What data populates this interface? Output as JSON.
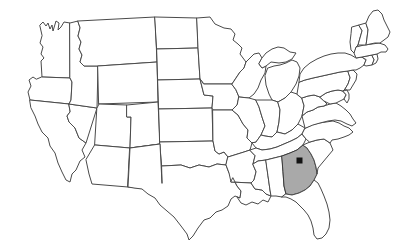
{
  "figure": {
    "kind": "choropleth-locator-map",
    "title": "",
    "caption": "",
    "background_color": "#ffffff",
    "width": 405,
    "height": 251
  },
  "map": {
    "region": "United States",
    "projection_style": "albers-usa-like",
    "default_state_fill": "#ffffff",
    "state_border_color": "#4a4a4a",
    "highlight_fill": "#a9a9a9",
    "highlight_border_color": "#3a3a3a",
    "marker_color": "#121212",
    "marker_shape": "square",
    "highlighted_states": [
      "Georgia"
    ],
    "markers": [
      {
        "name": "capital-marker",
        "state": "Georgia",
        "label": "",
        "x": 299.5,
        "y": 160.5,
        "size": 6
      }
    ],
    "states": [
      {
        "code": "WA",
        "name": "Washington",
        "highlighted": false
      },
      {
        "code": "OR",
        "name": "Oregon",
        "highlighted": false
      },
      {
        "code": "CA",
        "name": "California",
        "highlighted": false
      },
      {
        "code": "NV",
        "name": "Nevada",
        "highlighted": false
      },
      {
        "code": "ID",
        "name": "Idaho",
        "highlighted": false
      },
      {
        "code": "MT",
        "name": "Montana",
        "highlighted": false
      },
      {
        "code": "WY",
        "name": "Wyoming",
        "highlighted": false
      },
      {
        "code": "UT",
        "name": "Utah",
        "highlighted": false
      },
      {
        "code": "AZ",
        "name": "Arizona",
        "highlighted": false
      },
      {
        "code": "CO",
        "name": "Colorado",
        "highlighted": false
      },
      {
        "code": "NM",
        "name": "New Mexico",
        "highlighted": false
      },
      {
        "code": "ND",
        "name": "North Dakota",
        "highlighted": false
      },
      {
        "code": "SD",
        "name": "South Dakota",
        "highlighted": false
      },
      {
        "code": "NE",
        "name": "Nebraska",
        "highlighted": false
      },
      {
        "code": "KS",
        "name": "Kansas",
        "highlighted": false
      },
      {
        "code": "OK",
        "name": "Oklahoma",
        "highlighted": false
      },
      {
        "code": "TX",
        "name": "Texas",
        "highlighted": false
      },
      {
        "code": "MN",
        "name": "Minnesota",
        "highlighted": false
      },
      {
        "code": "IA",
        "name": "Iowa",
        "highlighted": false
      },
      {
        "code": "MO",
        "name": "Missouri",
        "highlighted": false
      },
      {
        "code": "AR",
        "name": "Arkansas",
        "highlighted": false
      },
      {
        "code": "LA",
        "name": "Louisiana",
        "highlighted": false
      },
      {
        "code": "WI",
        "name": "Wisconsin",
        "highlighted": false
      },
      {
        "code": "IL",
        "name": "Illinois",
        "highlighted": false
      },
      {
        "code": "MI",
        "name": "Michigan",
        "highlighted": false
      },
      {
        "code": "IN",
        "name": "Indiana",
        "highlighted": false
      },
      {
        "code": "OH",
        "name": "Ohio",
        "highlighted": false
      },
      {
        "code": "KY",
        "name": "Kentucky",
        "highlighted": false
      },
      {
        "code": "TN",
        "name": "Tennessee",
        "highlighted": false
      },
      {
        "code": "MS",
        "name": "Mississippi",
        "highlighted": false
      },
      {
        "code": "AL",
        "name": "Alabama",
        "highlighted": false
      },
      {
        "code": "GA",
        "name": "Georgia",
        "highlighted": true
      },
      {
        "code": "FL",
        "name": "Florida",
        "highlighted": false
      },
      {
        "code": "SC",
        "name": "South Carolina",
        "highlighted": false
      },
      {
        "code": "NC",
        "name": "North Carolina",
        "highlighted": false
      },
      {
        "code": "VA",
        "name": "Virginia",
        "highlighted": false
      },
      {
        "code": "WV",
        "name": "West Virginia",
        "highlighted": false
      },
      {
        "code": "MD",
        "name": "Maryland",
        "highlighted": false
      },
      {
        "code": "DE",
        "name": "Delaware",
        "highlighted": false
      },
      {
        "code": "PA",
        "name": "Pennsylvania",
        "highlighted": false
      },
      {
        "code": "NJ",
        "name": "New Jersey",
        "highlighted": false
      },
      {
        "code": "NY",
        "name": "New York",
        "highlighted": false
      },
      {
        "code": "CT",
        "name": "Connecticut",
        "highlighted": false
      },
      {
        "code": "RI",
        "name": "Rhode Island",
        "highlighted": false
      },
      {
        "code": "MA",
        "name": "Massachusetts",
        "highlighted": false
      },
      {
        "code": "VT",
        "name": "Vermont",
        "highlighted": false
      },
      {
        "code": "NH",
        "name": "New Hampshire",
        "highlighted": false
      },
      {
        "code": "ME",
        "name": "Maine",
        "highlighted": false
      }
    ]
  }
}
